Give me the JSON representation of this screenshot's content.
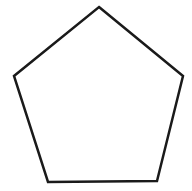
{
  "canvas": {
    "width": 192,
    "height": 191,
    "background_color": "#ffffff",
    "alt_text": "Pentagon"
  },
  "figure": {
    "name": "pentagon",
    "shape_type": "polygon",
    "sides": 5,
    "label": "Pentagon",
    "fill_color": "#ffffff",
    "stroke_color": "#1a1a1a",
    "stroke_width": 2.5,
    "points_string": "99,7 183,76 157,181 48,182 14,76",
    "vertices": [
      {
        "name": "apex",
        "x": 99,
        "y": 7
      },
      {
        "name": "upper-right",
        "x": 183,
        "y": 76
      },
      {
        "name": "lower-right",
        "x": 157,
        "y": 181
      },
      {
        "name": "lower-left",
        "x": 48,
        "y": 182
      },
      {
        "name": "upper-left",
        "x": 14,
        "y": 76
      }
    ],
    "edges": [
      {
        "name": "upper-right-edge",
        "from": "apex",
        "to": "upper-right"
      },
      {
        "name": "right-edge",
        "from": "upper-right",
        "to": "lower-right"
      },
      {
        "name": "bottom-edge",
        "from": "lower-right",
        "to": "lower-left"
      },
      {
        "name": "left-edge",
        "from": "lower-left",
        "to": "upper-left"
      },
      {
        "name": "upper-left-edge",
        "from": "upper-left",
        "to": "apex"
      }
    ]
  }
}
